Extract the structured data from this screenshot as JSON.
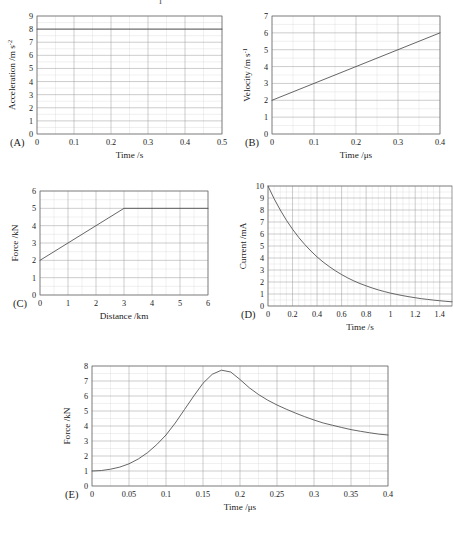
{
  "figure": {
    "background": "#ffffff",
    "grid_major_color": "#9a9a9a",
    "grid_minor_color": "#d8d8d8",
    "curve_color": "#4a4a4a",
    "frame_color": "#6e6e6e",
    "top_artifact": "I"
  },
  "panels": [
    {
      "label": "(A)",
      "chart_data": {
        "type": "line",
        "title": "",
        "xlabel": "Time /s",
        "ylabel": "Acceleration /m s",
        "ylabel_sup": "-2",
        "xlim": [
          0,
          0.5
        ],
        "ylim": [
          0,
          9
        ],
        "xticks": [
          "0",
          "0.1",
          "0.2",
          "0.3",
          "0.4",
          "0.5"
        ],
        "xtick_values": [
          0,
          0.1,
          0.2,
          0.3,
          0.4,
          0.5
        ],
        "yticks": [
          "0",
          "1",
          "2",
          "3",
          "4",
          "5",
          "6",
          "7",
          "8",
          "9"
        ],
        "ytick_values": [
          0,
          1,
          2,
          3,
          4,
          5,
          6,
          7,
          8,
          9
        ],
        "grid": true,
        "minor_grid_y": true,
        "series": [
          {
            "name": "acceleration",
            "x": [
              0,
              0.5
            ],
            "values": [
              8,
              8
            ]
          }
        ]
      }
    },
    {
      "label": "(B)",
      "chart_data": {
        "type": "line",
        "title": "",
        "xlabel": "Time /μs",
        "ylabel": "Velocity /m s",
        "ylabel_sup": "-1",
        "xlim": [
          0,
          0.4
        ],
        "ylim": [
          0,
          7
        ],
        "xticks": [
          "0",
          "0.1",
          "0.2",
          "0.3",
          "0.4"
        ],
        "xtick_values": [
          0,
          0.1,
          0.2,
          0.3,
          0.4
        ],
        "yticks": [
          "0",
          "1",
          "2",
          "3",
          "4",
          "5",
          "6",
          "7"
        ],
        "ytick_values": [
          0,
          1,
          2,
          3,
          4,
          5,
          6,
          7
        ],
        "grid": true,
        "minor_grid_y": true,
        "series": [
          {
            "name": "velocity",
            "x": [
              0,
              0.4
            ],
            "values": [
              2,
              6
            ]
          }
        ]
      }
    },
    {
      "label": "(C)",
      "chart_data": {
        "type": "line",
        "title": "",
        "xlabel": "Distance /km",
        "ylabel": "Force /kN",
        "ylabel_sup": "",
        "xlim": [
          0,
          6
        ],
        "ylim": [
          0,
          6
        ],
        "xticks": [
          "0",
          "1",
          "2",
          "3",
          "4",
          "5",
          "6"
        ],
        "xtick_values": [
          0,
          1,
          2,
          3,
          4,
          5,
          6
        ],
        "yticks": [
          "0",
          "1",
          "2",
          "3",
          "4",
          "5",
          "6"
        ],
        "ytick_values": [
          0,
          1,
          2,
          3,
          4,
          5,
          6
        ],
        "grid": true,
        "minor_grid_y": true,
        "series": [
          {
            "name": "force",
            "x": [
              0,
              3,
              6
            ],
            "values": [
              2,
              5,
              5
            ]
          }
        ]
      }
    },
    {
      "label": "(D)",
      "chart_data": {
        "type": "line",
        "title": "",
        "xlabel": "Time /s",
        "ylabel": "Current /mA",
        "ylabel_sup": "",
        "xlim": [
          0,
          1.5
        ],
        "ylim": [
          0,
          10
        ],
        "xticks": [
          "0",
          "0.2",
          "0.4",
          "0.6",
          "0.8",
          "1",
          "1.2",
          "1.4"
        ],
        "xtick_values": [
          0,
          0.2,
          0.4,
          0.6,
          0.8,
          1,
          1.2,
          1.4
        ],
        "yticks": [
          "0",
          "1",
          "2",
          "3",
          "4",
          "5",
          "6",
          "7",
          "8",
          "9",
          "10"
        ],
        "ytick_values": [
          0,
          1,
          2,
          3,
          4,
          5,
          6,
          7,
          8,
          9,
          10
        ],
        "grid": true,
        "minor_grid_y": true,
        "series": [
          {
            "name": "current",
            "x": [
              0,
              0.05,
              0.1,
              0.15,
              0.2,
              0.25,
              0.3,
              0.35,
              0.4,
              0.45,
              0.5,
              0.55,
              0.6,
              0.65,
              0.7,
              0.75,
              0.8,
              0.85,
              0.9,
              0.95,
              1.0,
              1.05,
              1.1,
              1.15,
              1.2,
              1.25,
              1.3,
              1.35,
              1.4,
              1.45,
              1.5
            ],
            "values": [
              10.0,
              8.94,
              8.0,
              7.15,
              6.4,
              5.72,
              5.12,
              4.58,
              4.09,
              3.66,
              3.28,
              2.93,
              2.62,
              2.34,
              2.09,
              1.87,
              1.68,
              1.5,
              1.34,
              1.2,
              1.07,
              0.96,
              0.86,
              0.77,
              0.69,
              0.61,
              0.55,
              0.49,
              0.44,
              0.39,
              0.35
            ]
          }
        ]
      }
    },
    {
      "label": "(E)",
      "chart_data": {
        "type": "line",
        "title": "",
        "xlabel": "Time /μs",
        "ylabel": "Force /kN",
        "ylabel_sup": "",
        "xlim": [
          0,
          0.4
        ],
        "ylim": [
          0,
          8
        ],
        "xticks": [
          "0",
          "0.05",
          "0.1",
          "0.15",
          "0.2",
          "0.25",
          "0.3",
          "0.35",
          "0.4"
        ],
        "xtick_values": [
          0,
          0.05,
          0.1,
          0.15,
          0.2,
          0.25,
          0.3,
          0.35,
          0.4
        ],
        "yticks": [
          "0",
          "1",
          "2",
          "3",
          "4",
          "5",
          "6",
          "7",
          "8"
        ],
        "ytick_values": [
          0,
          1,
          2,
          3,
          4,
          5,
          6,
          7,
          8
        ],
        "grid": true,
        "minor_grid_y": true,
        "series": [
          {
            "name": "force",
            "x": [
              0,
              0.0125,
              0.025,
              0.0375,
              0.05,
              0.0625,
              0.075,
              0.0875,
              0.1,
              0.1125,
              0.125,
              0.1375,
              0.15,
              0.1625,
              0.175,
              0.1875,
              0.2,
              0.2125,
              0.225,
              0.2375,
              0.25,
              0.2625,
              0.275,
              0.2875,
              0.3,
              0.3125,
              0.325,
              0.3375,
              0.35,
              0.3625,
              0.375,
              0.3875,
              0.4
            ],
            "values": [
              1.0,
              1.03,
              1.12,
              1.26,
              1.48,
              1.8,
              2.22,
              2.76,
              3.4,
              4.2,
              5.1,
              6.0,
              6.85,
              7.45,
              7.72,
              7.6,
              7.1,
              6.55,
              6.1,
              5.72,
              5.4,
              5.12,
              4.86,
              4.62,
              4.4,
              4.2,
              4.05,
              3.9,
              3.76,
              3.65,
              3.55,
              3.46,
              3.4
            ]
          }
        ]
      }
    }
  ]
}
